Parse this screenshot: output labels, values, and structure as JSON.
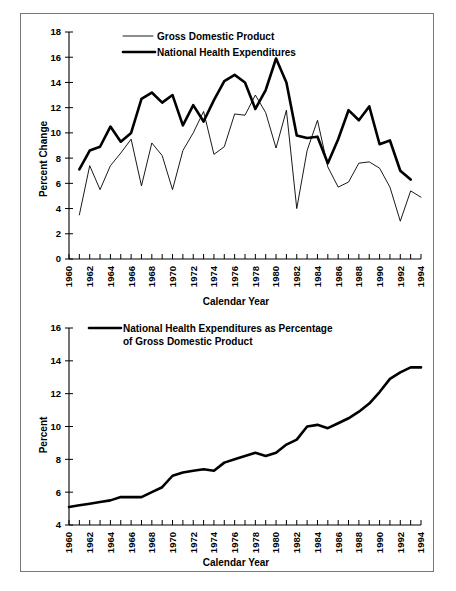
{
  "figure": {
    "background": "#ffffff",
    "border_color": "#777777",
    "line_color": "#000000"
  },
  "chart_data": [
    {
      "id": "top",
      "type": "line",
      "title": "",
      "xlabel": "Calendar Year",
      "ylabel": "Percent Change",
      "xlim": [
        1960,
        1994
      ],
      "ylim": [
        0,
        18
      ],
      "yticks": [
        0,
        2,
        4,
        6,
        8,
        10,
        12,
        14,
        16,
        18
      ],
      "xticks": [
        1960,
        1962,
        1964,
        1966,
        1968,
        1970,
        1972,
        1974,
        1976,
        1978,
        1980,
        1982,
        1984,
        1986,
        1988,
        1990,
        1992,
        1994
      ],
      "xtick_labels": [
        "1960",
        "1962",
        "1964",
        "1966",
        "1968",
        "1970",
        "1972",
        "1974",
        "1976",
        "1978",
        "1980",
        "1982",
        "1984",
        "1986",
        "1988",
        "1990",
        "1992",
        "1994"
      ],
      "minor_xticks_every": 1,
      "grid": false,
      "legend_position": "top-left",
      "x": [
        1961,
        1962,
        1963,
        1964,
        1965,
        1966,
        1967,
        1968,
        1969,
        1970,
        1971,
        1972,
        1973,
        1974,
        1975,
        1976,
        1977,
        1978,
        1979,
        1980,
        1981,
        1982,
        1983,
        1984,
        1985,
        1986,
        1987,
        1988,
        1989,
        1990,
        1991,
        1992,
        1993,
        1994
      ],
      "series": [
        {
          "name": "Gross Domestic Product",
          "style": "thin",
          "values": [
            3.5,
            7.4,
            5.5,
            7.4,
            8.4,
            9.5,
            5.8,
            9.2,
            8.2,
            5.5,
            8.6,
            10.0,
            11.7,
            8.3,
            8.9,
            11.5,
            11.4,
            13.0,
            11.6,
            8.8,
            11.8,
            4.0,
            8.6,
            11.0,
            7.3,
            5.7,
            6.1,
            7.6,
            7.7,
            7.2,
            5.7,
            3.0,
            5.4,
            4.9,
            5.7
          ]
        },
        {
          "name": "National Health Expenditures",
          "style": "thick",
          "values": [
            7.1,
            8.6,
            8.9,
            10.5,
            9.3,
            10.0,
            12.7,
            13.2,
            12.4,
            13.0,
            10.6,
            12.2,
            10.9,
            12.6,
            14.1,
            14.6,
            14.0,
            11.9,
            13.4,
            15.9,
            14.0,
            9.8,
            9.6,
            9.7,
            7.6,
            9.5,
            11.8,
            11.0,
            12.1,
            9.1,
            9.4,
            7.0,
            6.3
          ]
        }
      ]
    },
    {
      "id": "bottom",
      "type": "line",
      "title": "",
      "xlabel": "Calendar Year",
      "ylabel": "Percent",
      "xlim": [
        1960,
        1994
      ],
      "ylim": [
        4,
        16
      ],
      "yticks": [
        4,
        6,
        8,
        10,
        12,
        14,
        16
      ],
      "xticks": [
        1960,
        1962,
        1964,
        1966,
        1968,
        1970,
        1972,
        1974,
        1976,
        1978,
        1980,
        1982,
        1984,
        1986,
        1988,
        1990,
        1992,
        1994
      ],
      "xtick_labels": [
        "1960",
        "1962",
        "1964",
        "1966",
        "1968",
        "1970",
        "1972",
        "1974",
        "1976",
        "1978",
        "1980",
        "1982",
        "1984",
        "1986",
        "1988",
        "1990",
        "1992",
        "1994"
      ],
      "minor_xticks_every": 1,
      "grid": false,
      "legend_position": "top-left",
      "x": [
        1960,
        1961,
        1962,
        1963,
        1964,
        1965,
        1966,
        1967,
        1968,
        1969,
        1970,
        1971,
        1972,
        1973,
        1974,
        1975,
        1976,
        1977,
        1978,
        1979,
        1980,
        1981,
        1982,
        1983,
        1984,
        1985,
        1986,
        1987,
        1988,
        1989,
        1990,
        1991,
        1992,
        1993,
        1994
      ],
      "series": [
        {
          "name": "National Health Expenditures as Percentage of Gross Domestic Product",
          "style": "thick",
          "values": [
            5.1,
            5.2,
            5.3,
            5.4,
            5.5,
            5.7,
            5.7,
            5.7,
            6.0,
            6.3,
            7.0,
            7.2,
            7.3,
            7.4,
            7.3,
            7.8,
            8.0,
            8.2,
            8.4,
            8.2,
            8.4,
            8.9,
            9.2,
            10.0,
            10.1,
            9.9,
            10.2,
            10.5,
            10.9,
            11.4,
            12.1,
            12.9,
            13.3,
            13.6,
            13.6
          ]
        }
      ]
    }
  ]
}
